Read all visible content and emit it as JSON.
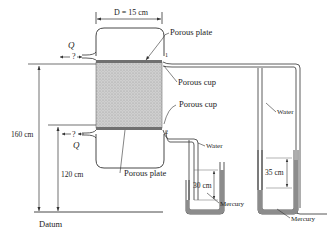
{
  "diagram": {
    "labels": {
      "diameter": "D = 15 cm",
      "porous_plate_top": "Porous plate",
      "porous_cup_top": "Porous cup",
      "porous_cup_bottom": "Porous cup",
      "porous_plate_bottom": "Porous plate",
      "flow_top": "Q",
      "flow_top_unknown": "?",
      "flow_bottom": "Q",
      "flow_bottom_unknown": "?",
      "point_1": "1",
      "point_2": "2",
      "height_total": "160 cm",
      "height_lower": "120 cm",
      "datum": "Datum",
      "water_left": "Water",
      "water_right": "Water",
      "mercury_left": "Mercury",
      "mercury_right": "Mercury",
      "manometer_left_diff": "30 cm",
      "manometer_right_diff": "35 cm"
    },
    "colors": {
      "line": "#333333",
      "soil": "#c8c8c8",
      "plate": "#7a7a7a",
      "mercury": "#8c8c8c"
    }
  }
}
